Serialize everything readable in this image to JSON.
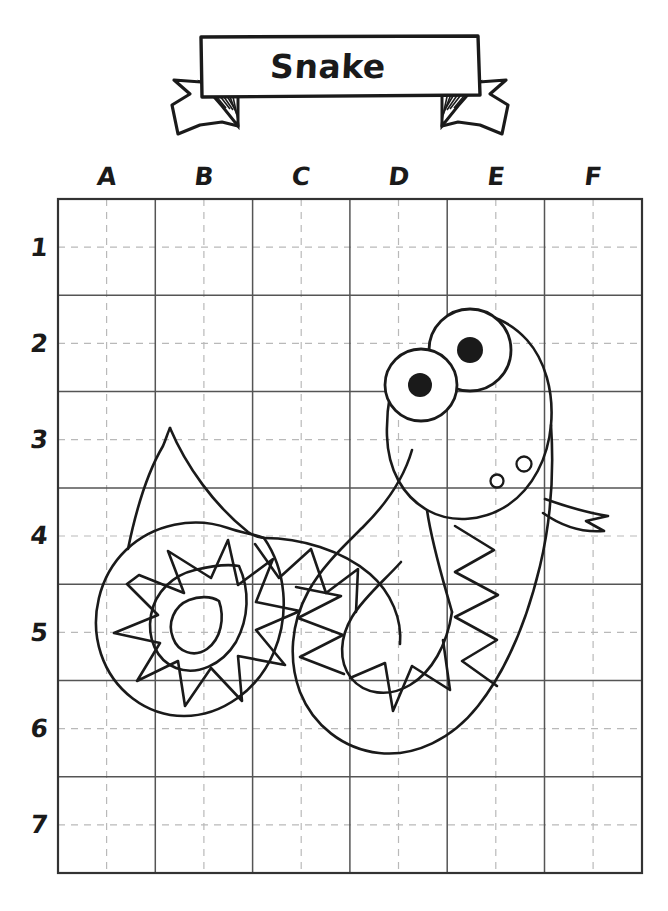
{
  "page": {
    "background_color": "#ffffff",
    "ink_color": "#1a1a1a",
    "width": 668,
    "height": 911,
    "worksheet_type": "grid-copy-drawing"
  },
  "banner": {
    "title": "Snake",
    "shape": "ribbon-banner",
    "box": {
      "x": 200,
      "y": 36,
      "width": 256,
      "height": 60
    },
    "tails": [
      "left-ribbon-tail",
      "right-ribbon-tail"
    ],
    "fold_hatching": true
  },
  "grid": {
    "origin_x": 58,
    "origin_y": 199,
    "cell_width": 97.3,
    "cell_height": 96.3,
    "columns": 6,
    "rows": 7,
    "column_labels": [
      "A",
      "B",
      "C",
      "D",
      "E",
      "F"
    ],
    "row_labels": [
      "1",
      "2",
      "3",
      "4",
      "5",
      "6",
      "7"
    ],
    "major_line_color": "#555555",
    "minor_line_color": "#b9b9b9",
    "minor_line_style": "dashed",
    "minor_subdivisions": 2,
    "border_color": "#333333"
  },
  "artwork": {
    "subject": "snake",
    "style": "line-art-outline",
    "stroke_color": "#1a1a1a",
    "fill": "none",
    "parts": [
      {
        "name": "head",
        "description": "rounded oval head in columns D-E rows 2-4"
      },
      {
        "name": "left-eye",
        "cx": 421,
        "cy": 385,
        "r": 36,
        "pupil_r": 12
      },
      {
        "name": "right-eye",
        "cx": 470,
        "cy": 350,
        "r": 41,
        "pupil_r": 13
      },
      {
        "name": "nostril-upper",
        "cx": 524,
        "cy": 464,
        "r": 7
      },
      {
        "name": "nostril-lower",
        "cx": 497,
        "cy": 481,
        "r": 6
      },
      {
        "name": "tongue",
        "description": "forked tongue extending right from mouth"
      },
      {
        "name": "body",
        "description": "U-shaped body curve through rows 4-6"
      },
      {
        "name": "zigzag-pattern",
        "description": "triangular zigzag scales along inner body edge"
      },
      {
        "name": "coiled-tail",
        "description": "spiral coil with star zigzag in columns A-B rows 4-6"
      },
      {
        "name": "tail-tip",
        "x": 170,
        "y": 428
      }
    ]
  }
}
